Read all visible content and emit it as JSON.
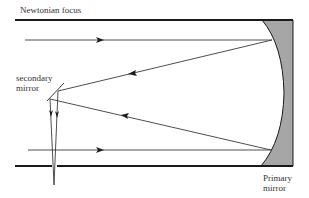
{
  "diagram": {
    "labels": {
      "newtonian_focus": "Newtonian focus",
      "secondary_mirror_line1": "secondary",
      "secondary_mirror_line2": "mirror",
      "primary_mirror_line1": "Primary",
      "primary_mirror_line2": "mirror"
    },
    "colors": {
      "tube": "#1a1a1a",
      "ray": "#3a3a3a",
      "mirror_fill": "#a6a6a6",
      "text": "#333333",
      "background": "#ffffff"
    },
    "components": [
      "tube-top-wall",
      "tube-bottom-wall",
      "primary-mirror",
      "secondary-mirror",
      "incoming-ray-top",
      "incoming-ray-bottom",
      "reflected-ray-top",
      "reflected-ray-bottom",
      "focus-rays"
    ]
  }
}
